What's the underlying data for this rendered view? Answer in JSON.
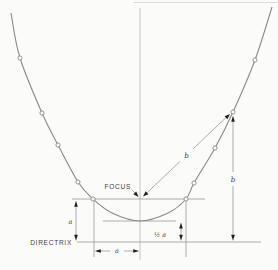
{
  "diagram": {
    "type": "parabola-focus-directrix-construction",
    "labels": {
      "focus": "FOCUS",
      "directrix": "DIRECTRIX",
      "dim_a_left": "a",
      "dim_a_bottom": "a",
      "dim_half_a": "½ a",
      "dim_b_slant": "b",
      "dim_b_vertical": "b"
    },
    "colors": {
      "background": "#fbfbfa",
      "line": "#9a9a9a",
      "curve": "#8a8a8a",
      "axis": "#b8b8b8",
      "text": "#414141",
      "arrow": "#1f1f1f"
    },
    "geometry": {
      "focus": [
        140,
        199
      ],
      "vertex": [
        140,
        221
      ],
      "directrix_y": 242,
      "point_p": [
        233,
        112
      ],
      "curve_points": [
        [
          11,
          13
        ],
        [
          20,
          58
        ],
        [
          42,
          113
        ],
        [
          58,
          145
        ],
        [
          78,
          182
        ],
        [
          93,
          199
        ],
        [
          112,
          213
        ],
        [
          140,
          221
        ],
        [
          168,
          213
        ],
        [
          186,
          199
        ],
        [
          194,
          183
        ],
        [
          215,
          148
        ],
        [
          233,
          112
        ],
        [
          255,
          60
        ],
        [
          272,
          7
        ]
      ],
      "markers": [
        [
          20,
          58
        ],
        [
          42,
          113
        ],
        [
          58,
          145
        ],
        [
          78,
          182
        ],
        [
          93,
          199
        ],
        [
          186,
          199
        ],
        [
          194,
          183
        ],
        [
          215,
          148
        ],
        [
          233,
          112
        ],
        [
          255,
          60
        ]
      ]
    }
  }
}
